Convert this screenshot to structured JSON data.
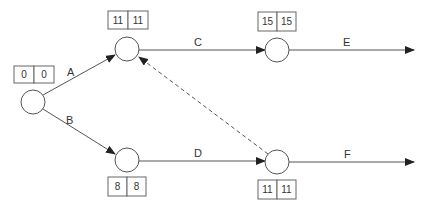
{
  "diagram": {
    "type": "activity-on-arrow network",
    "nodes": [
      {
        "id": "n1",
        "es": "0",
        "lf": "0",
        "cx": 33,
        "cy": 102,
        "box_x": 14,
        "box_y": 66,
        "box_pos": "above"
      },
      {
        "id": "n2",
        "es": "11",
        "lf": "11",
        "cx": 127,
        "cy": 49,
        "box_x": 108,
        "box_y": 11,
        "box_pos": "above"
      },
      {
        "id": "n3",
        "es": "8",
        "lf": "8",
        "cx": 127,
        "cy": 160,
        "box_x": 108,
        "box_y": 177,
        "box_pos": "below"
      },
      {
        "id": "n4",
        "es": "15",
        "lf": "15",
        "cx": 277,
        "cy": 50,
        "box_x": 258,
        "box_y": 12,
        "box_pos": "above"
      },
      {
        "id": "n5",
        "es": "11",
        "lf": "11",
        "cx": 277,
        "cy": 162,
        "box_x": 258,
        "box_y": 180,
        "box_pos": "below"
      }
    ],
    "activities": [
      {
        "label": "A",
        "from": "n1",
        "to": "n2"
      },
      {
        "label": "B",
        "from": "n1",
        "to": "n3"
      },
      {
        "label": "C",
        "from": "n2",
        "to": "n4"
      },
      {
        "label": "D",
        "from": "n3",
        "to": "n5"
      },
      {
        "label": "E",
        "from": "n4",
        "to": "end"
      },
      {
        "label": "F",
        "from": "n5",
        "to": "end"
      }
    ],
    "dummy_activities": [
      {
        "from": "n5",
        "to": "n2",
        "style": "dashed"
      }
    ]
  }
}
